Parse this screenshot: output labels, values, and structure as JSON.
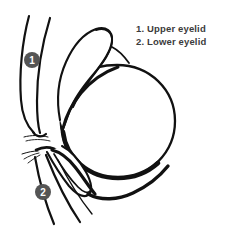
{
  "figure": {
    "background_color": "#ffffff",
    "ink_color": "#111111",
    "marker_fill_color": "#555555",
    "marker_text_color": "#ffffff",
    "legend_text_color": "#3b3b3b"
  },
  "legend": {
    "items": [
      {
        "number": "1.",
        "label": "Upper eyelid",
        "full": "1. Upper eyelid"
      },
      {
        "number": "2.",
        "label": "Lower eyelid",
        "full": "2. Lower eyelid"
      }
    ]
  },
  "markers": [
    {
      "id": "marker-1",
      "text": "1",
      "cx": 32,
      "cy": 60,
      "r": 8,
      "refers_to": "Upper eyelid"
    },
    {
      "id": "marker-2",
      "text": "2",
      "cx": 43,
      "cy": 192,
      "r": 8,
      "refers_to": "Lower eyelid"
    }
  ],
  "parts": {
    "eyeball": {
      "name": "eyeball",
      "cx": 120,
      "cy": 121,
      "r": 56
    },
    "upper_eyelid": {
      "name": "upper-eyelid"
    },
    "lower_eyelid": {
      "name": "lower-eyelid"
    },
    "upper_lashes": {
      "name": "upper-eyelashes"
    },
    "lower_lashes": {
      "name": "lower-eyelashes"
    },
    "canthus": {
      "name": "medial-canthus"
    }
  }
}
